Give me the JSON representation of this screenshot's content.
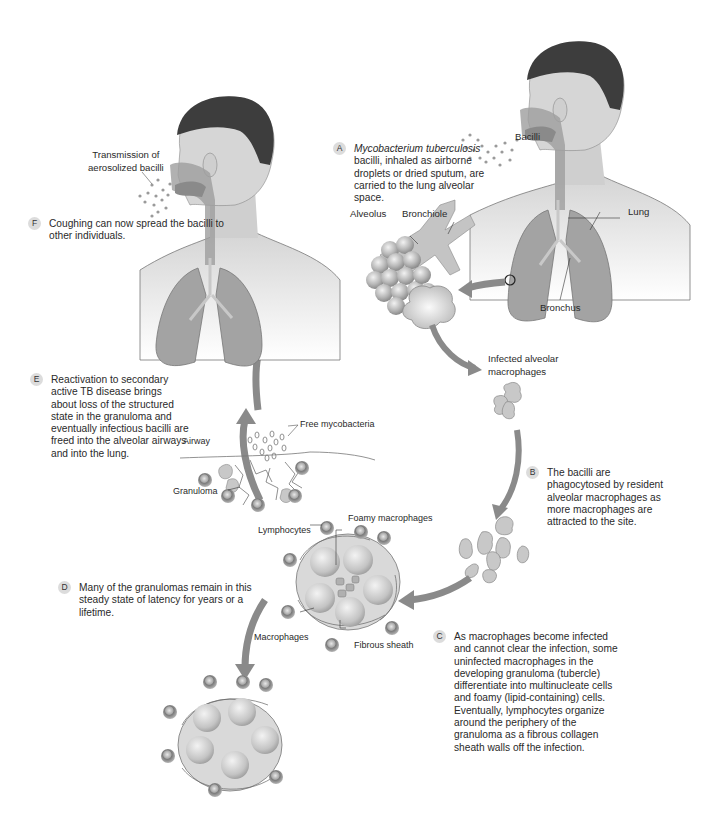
{
  "figure": {
    "steps": [
      {
        "letter": "A",
        "italic": "Mycobacterium tuberculosis",
        "text": "bacilli, inhaled as airborne droplets or dried sputum, are carried to the lung alveolar space."
      },
      {
        "letter": "B",
        "text": "The bacilli are phagocytosed by resident alveolar macrophages as more macrophages are attracted to the site."
      },
      {
        "letter": "C",
        "text": "As macrophages become infected and cannot clear the infection, some uninfected macrophages in the developing granuloma (tubercle) differentiate into multinucleate cells and foamy (lipid-containing) cells. Eventually, lymphocytes organize around the periphery of the granuloma as a fibrous collagen sheath walls off the infection."
      },
      {
        "letter": "D",
        "text": "Many of the granulomas remain in this steady state of latency for years or a lifetime."
      },
      {
        "letter": "E",
        "text": "Reactivation to secondary active TB disease brings about loss of the structured state in the granuloma and eventually infectious bacilli are freed into the alveolar airways and into the lung."
      },
      {
        "letter": "F",
        "text": "Coughing can now spread the bacilli to other individuals."
      }
    ],
    "labels": {
      "bacilli": "Bacilli",
      "alveolus": "Alveolus",
      "bronchiole": "Bronchiole",
      "lung": "Lung",
      "bronchus": "Bronchus",
      "infected_macrophages_1": "Infected alveolar",
      "infected_macrophages_2": "macrophages",
      "transmission_1": "Transmission of",
      "transmission_2": "aerosolized bacilli",
      "free_mycobacteria": "Free mycobacteria",
      "airway": "Airway",
      "granuloma": "Granuloma",
      "lymphocytes": "Lymphocytes",
      "foamy_macrophages": "Foamy macrophages",
      "macrophages": "Macrophages",
      "fibrous_sheath": "Fibrous sheath"
    },
    "colors": {
      "arrow": "#8a8a8a",
      "hair": "#3c3c3c",
      "skin": "#d9d9d9",
      "lung": "#9a9a9a",
      "cell": "#bdbdbd",
      "badge": "#dcdcdc"
    }
  }
}
